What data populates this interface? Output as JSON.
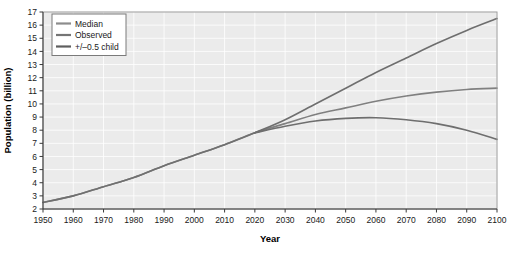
{
  "chart_data": {
    "type": "line",
    "title": "",
    "xlabel": "Year",
    "ylabel": "Population (billion)",
    "xlim": [
      1950,
      2100
    ],
    "ylim": [
      2,
      17
    ],
    "xticks": [
      1950,
      1960,
      1970,
      1980,
      1990,
      2000,
      2010,
      2020,
      2030,
      2040,
      2050,
      2060,
      2070,
      2080,
      2090,
      2100
    ],
    "yticks": [
      2,
      3,
      4,
      5,
      6,
      7,
      8,
      9,
      10,
      11,
      12,
      13,
      14,
      15,
      16,
      17
    ],
    "grid": true,
    "legend_position": "top-left",
    "plot_background": "#ebebeb",
    "grid_color": "#ffffff",
    "series": [
      {
        "name": "Median",
        "color": "#808080",
        "x": [
          1950,
          1960,
          1970,
          1980,
          1990,
          2000,
          2010,
          2020,
          2030,
          2040,
          2050,
          2060,
          2070,
          2080,
          2090,
          2100
        ],
        "values": [
          2.5,
          3.0,
          3.7,
          4.4,
          5.3,
          6.1,
          6.9,
          7.8,
          8.5,
          9.2,
          9.7,
          10.2,
          10.6,
          10.9,
          11.1,
          11.2
        ]
      },
      {
        "name": "Observed",
        "color": "#707070",
        "x": [
          1950,
          1960,
          1970,
          1980,
          1990,
          2000,
          2010,
          2020
        ],
        "values": [
          2.5,
          3.0,
          3.7,
          4.4,
          5.3,
          6.1,
          6.9,
          7.8
        ]
      },
      {
        "name": "+/-0.5 child",
        "color": "#6e6e6e",
        "x": [
          2020,
          2030,
          2040,
          2050,
          2060,
          2070,
          2080,
          2090,
          2100
        ],
        "upper": [
          7.8,
          8.8,
          10.0,
          11.2,
          12.4,
          13.5,
          14.6,
          15.6,
          16.5
        ],
        "lower": [
          7.8,
          8.3,
          8.7,
          8.9,
          8.95,
          8.8,
          8.5,
          8.0,
          7.3
        ]
      }
    ]
  },
  "legend": {
    "items": [
      {
        "label": "Median",
        "color": "#8c8c8c"
      },
      {
        "label": "Observed",
        "color": "#757575"
      },
      {
        "label": "+/–0.5 child",
        "color": "#5e5e5e"
      }
    ]
  },
  "axes": {
    "x_title": "Year",
    "y_title": "Population (billion)"
  }
}
